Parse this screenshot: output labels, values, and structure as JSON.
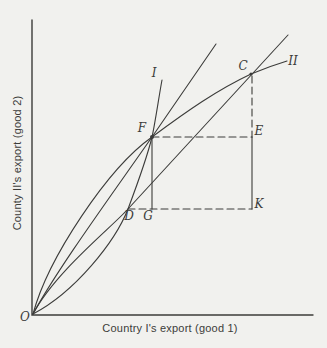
{
  "colors": {
    "background": "#f1f1ee",
    "ink": "#3c3c3a"
  },
  "axes": {
    "x_label": "Country I's export (good 1)",
    "y_label": "County II's export (good 2)"
  },
  "labels": {
    "origin": "O",
    "D": "D",
    "G": "G",
    "F": "F",
    "E": "E",
    "C": "C",
    "K": "K",
    "curve_I": "I",
    "curve_II": "II"
  }
}
